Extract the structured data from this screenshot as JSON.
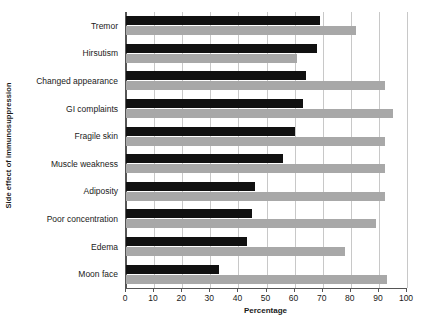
{
  "chart_data": {
    "type": "bar",
    "orientation": "horizontal",
    "title": "",
    "xlabel": "Percentage",
    "ylabel": "Side effect of immunosuppression",
    "xlim": [
      0,
      100
    ],
    "xticks": [
      0,
      10,
      20,
      30,
      40,
      50,
      60,
      70,
      80,
      90,
      100
    ],
    "grid": true,
    "legend": "none",
    "categories": [
      "Tremor",
      "Hirsutism",
      "Changed appearance",
      "GI complaints",
      "Fragile skin",
      "Muscle weakness",
      "Adiposity",
      "Poor concentration",
      "Edema",
      "Moon face"
    ],
    "series": [
      {
        "name": "series-a",
        "color": "#111111",
        "values": [
          69,
          68,
          64,
          63,
          60,
          56,
          46,
          45,
          43,
          33
        ]
      },
      {
        "name": "series-b",
        "color": "#a8a8a8",
        "values": [
          82,
          61,
          92,
          95,
          92,
          92,
          92,
          89,
          78,
          93
        ]
      }
    ]
  }
}
